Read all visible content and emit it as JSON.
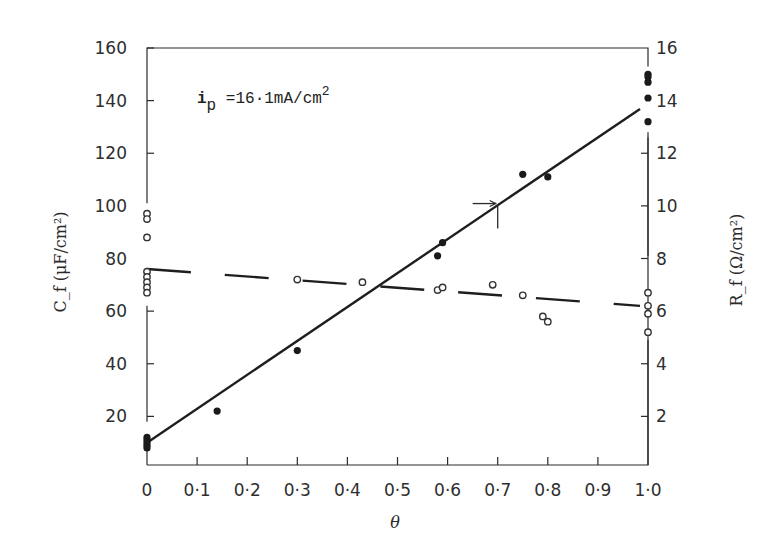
{
  "chart_data": {
    "type": "scatter",
    "title": "",
    "annotation": {
      "text_main": "i",
      "text_sub": "p",
      "text_rest": " =16·1mA/cm",
      "text_sup": "2"
    },
    "xlabel": "θ",
    "ylabel_left": "C_f (μF/cm²)",
    "ylabel_right": "R_f (Ω/cm²)",
    "xlim": [
      0,
      1.0
    ],
    "ylim_left": [
      0,
      160
    ],
    "ylim_right": [
      0,
      16
    ],
    "x_ticks": [
      "0",
      "0·1",
      "0·2",
      "0·3",
      "0·4",
      "0·5",
      "0·6",
      "0·7",
      "0·8",
      "0·9",
      "1·0"
    ],
    "y_ticks_left": [
      "20",
      "40",
      "60",
      "80",
      "100",
      "120",
      "140",
      "160"
    ],
    "y_ticks_right": [
      "2",
      "4",
      "6",
      "8",
      "10",
      "12",
      "14",
      "16"
    ],
    "grid": false,
    "series": [
      {
        "name": "C_f",
        "marker": "filled-circle",
        "axis": "left",
        "points": [
          [
            0,
            8
          ],
          [
            0,
            9
          ],
          [
            0,
            10
          ],
          [
            0,
            11
          ],
          [
            0,
            12
          ],
          [
            0.14,
            22
          ],
          [
            0.3,
            45
          ],
          [
            0.58,
            81
          ],
          [
            0.59,
            86
          ],
          [
            0.75,
            112
          ],
          [
            0.8,
            111
          ],
          [
            1.0,
            132
          ],
          [
            1.0,
            141
          ],
          [
            1.0,
            147
          ],
          [
            1.0,
            149
          ],
          [
            1.0,
            150
          ]
        ],
        "fit_line": {
          "style": "solid",
          "from": [
            0,
            10
          ],
          "to": [
            1.0,
            138
          ]
        }
      },
      {
        "name": "R_f",
        "marker": "open-circle",
        "axis": "right",
        "points": [
          [
            0,
            9.7
          ],
          [
            0,
            9.5
          ],
          [
            0,
            8.8
          ],
          [
            0,
            7.5
          ],
          [
            0,
            7.3
          ],
          [
            0,
            7.1
          ],
          [
            0,
            6.9
          ],
          [
            0,
            6.7
          ],
          [
            0.3,
            7.2
          ],
          [
            0.43,
            7.1
          ],
          [
            0.58,
            6.8
          ],
          [
            0.59,
            6.9
          ],
          [
            0.69,
            7.0
          ],
          [
            0.75,
            6.6
          ],
          [
            0.79,
            5.8
          ],
          [
            0.8,
            5.6
          ],
          [
            1.0,
            6.7
          ],
          [
            1.0,
            6.2
          ],
          [
            1.0,
            5.9
          ],
          [
            1.0,
            5.2
          ]
        ],
        "fit_line": {
          "style": "dashed",
          "from": [
            0,
            7.6
          ],
          "to": [
            1.0,
            6.2
          ]
        }
      }
    ],
    "markers": [
      {
        "type": "arrow-crosshair",
        "x": 0.7,
        "y_left": 100
      }
    ]
  },
  "colors": {
    "ink": "#2a2a2a",
    "background": "#ffffff"
  }
}
